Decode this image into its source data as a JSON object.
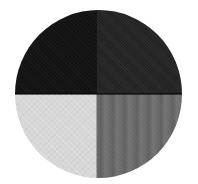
{
  "swatch": {
    "shape": "circle",
    "quadrants": [
      {
        "position": "top-left",
        "shade": "black",
        "color": "#141414",
        "texture": "fine-knit"
      },
      {
        "position": "top-right",
        "shade": "charcoal",
        "color": "#242424",
        "texture": "fine-knit"
      },
      {
        "position": "bottom-left",
        "shade": "light-gray",
        "color": "#d7d7d7",
        "texture": "fine-knit"
      },
      {
        "position": "bottom-right",
        "shade": "medium-gray",
        "color": "#6b6b6b",
        "texture": "vertical-rib"
      }
    ]
  }
}
